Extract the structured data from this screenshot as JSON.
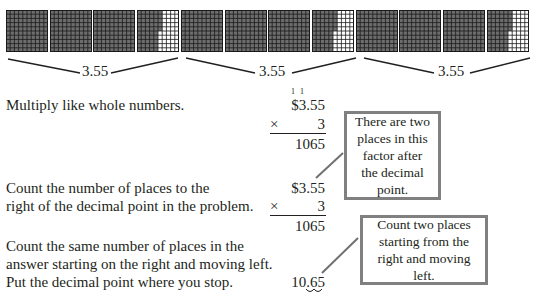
{
  "figure": {
    "grids": {
      "total": 12,
      "per_group": 4,
      "cells_per_side": 10,
      "group_value_label": "3.55",
      "partial_grid_shaded_columns": 5.5,
      "shaded_color": "#6d6d6d",
      "empty_color": "#ffffff",
      "line_color": "#1a1a1a"
    },
    "braces": [
      {
        "label": "3.55"
      },
      {
        "label": "3.55"
      },
      {
        "label": "3.55"
      }
    ]
  },
  "steps": [
    {
      "lines": [
        "Multiply like whole numbers."
      ]
    },
    {
      "lines": [
        "Count the number of places to the",
        "right of the decimal point in the problem."
      ]
    },
    {
      "lines": [
        "Count the same number of places in the",
        "answer starting on the right and moving left.",
        "Put the decimal point where you stop."
      ]
    }
  ],
  "work": {
    "block1": {
      "carries": [
        "1",
        "1"
      ],
      "multiplicand": "$3.55",
      "multiplier_sign": "×",
      "multiplier": "3",
      "product": "1065"
    },
    "block2": {
      "multiplicand": "$3.55",
      "multiplier_sign": "×",
      "multiplier": "3",
      "product": "1065"
    },
    "block3": {
      "answer": "10.65"
    }
  },
  "callouts": [
    {
      "text": "There are two places in this factor after the decimal point."
    },
    {
      "text": "Count two places starting from the right and moving left."
    }
  ],
  "colors": {
    "text": "#231f20",
    "callout_border": "#808080",
    "connector": "#707070"
  }
}
